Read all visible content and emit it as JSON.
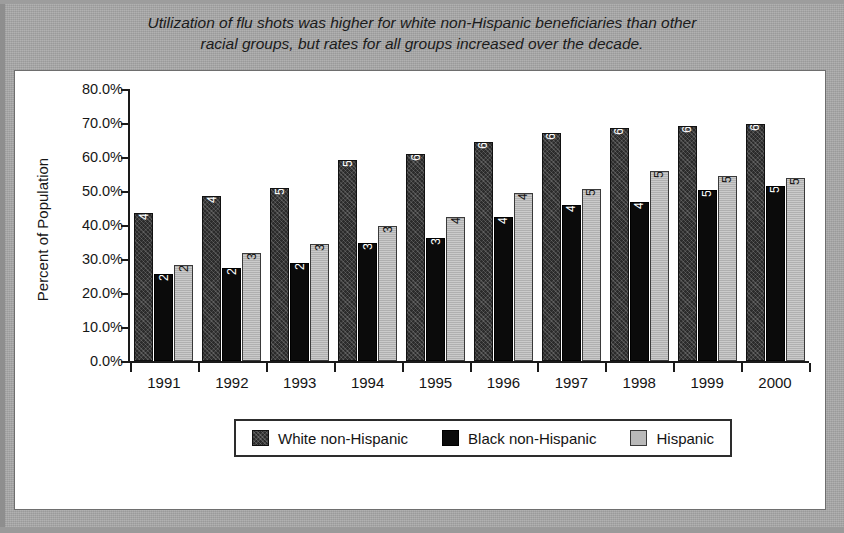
{
  "title": {
    "line1": "Utilization of flu shots was higher for white non-Hispanic beneficiaries than other",
    "line2": "racial groups, but rates for all groups increased over the decade."
  },
  "colors": {
    "mat_background": "#a9a9a9",
    "panel_background": "#ffffff",
    "axis": "#1a1a1a",
    "series_white_non_hispanic": "#2b2b2b",
    "series_black_non_hispanic": "#0b0b0b",
    "series_hispanic": "#b9b9b9"
  },
  "chart_data": {
    "type": "bar",
    "title": "Utilization of flu shots was higher for white non-Hispanic beneficiaries than other racial groups, but rates for all groups increased over the decade.",
    "xlabel": "",
    "ylabel": "Percent of Population",
    "ylim": [
      0,
      80
    ],
    "ytick_labels": [
      "80.0%",
      "70.0%",
      "60.0%",
      "50.0%",
      "40.0%",
      "30.0%",
      "20.0%",
      "10.0%",
      "0.0%"
    ],
    "ytick_values": [
      80,
      70,
      60,
      50,
      40,
      30,
      20,
      10,
      0
    ],
    "grid": false,
    "legend_position": "bottom",
    "categories": [
      "1991",
      "1992",
      "1993",
      "1994",
      "1995",
      "1996",
      "1997",
      "1998",
      "1999",
      "2000"
    ],
    "series": [
      {
        "name": "White non-Hispanic",
        "values": [
          43.4,
          48.6,
          51.0,
          59.0,
          60.8,
          64.4,
          67.0,
          68.6,
          69.0,
          69.8
        ],
        "labels": [
          "43.4%",
          "48.6%",
          "51.0%",
          "59.0%",
          "60.8%",
          "64.4%",
          "67.0%",
          "68.6%",
          "69.0%",
          "69.8%"
        ]
      },
      {
        "name": "Black non-Hispanic",
        "values": [
          25.5,
          27.5,
          28.9,
          34.8,
          36.3,
          42.5,
          46.0,
          46.9,
          50.2,
          51.5
        ],
        "labels": [
          "25.5%",
          "27.5%",
          "28.9%",
          "34.8%",
          "36.3%",
          "42.5%",
          "46.0%",
          "46.9%",
          "50.2%",
          "51.5%"
        ]
      },
      {
        "name": "Hispanic",
        "values": [
          28.1,
          31.7,
          34.3,
          39.6,
          42.3,
          49.4,
          50.5,
          56.0,
          54.5,
          53.8
        ],
        "labels": [
          "28.1%",
          "31.7%",
          "34.3%",
          "39.6%",
          "42.3%",
          "49.4%",
          "50.5%",
          "56.0%",
          "54.5%",
          "53.8%"
        ]
      }
    ]
  }
}
